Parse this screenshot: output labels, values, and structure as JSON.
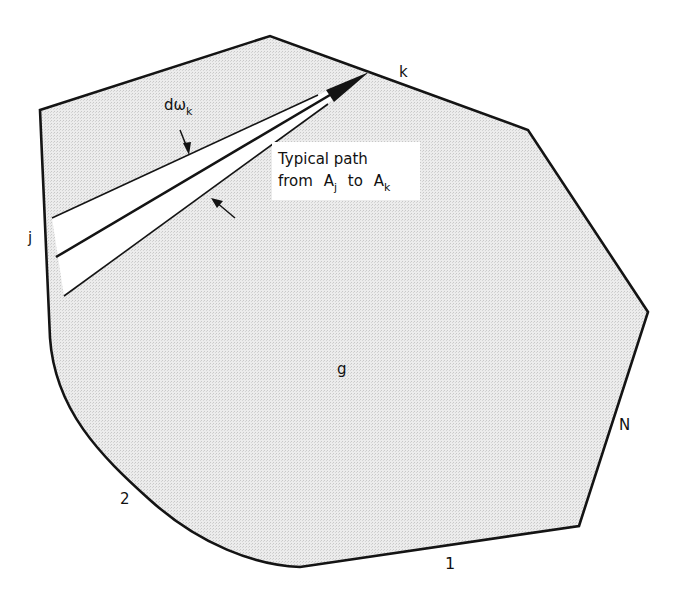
{
  "figure": {
    "colors": {
      "fill": "#e3e3e3",
      "stroke": "#141414",
      "background": "#ffffff"
    },
    "labels": {
      "region": "g",
      "vertex_j": "j",
      "vertex_k": "k",
      "side_1": "1",
      "side_2": "2",
      "side_N": "N",
      "solid_angle_d": "dω",
      "solid_angle_sub": "k",
      "path_line1": "Typical path",
      "path_line2_from": "from",
      "path_A1": "A",
      "path_A1_sub": "j",
      "path_to": "to",
      "path_A2": "A",
      "path_A2_sub": "k"
    }
  }
}
